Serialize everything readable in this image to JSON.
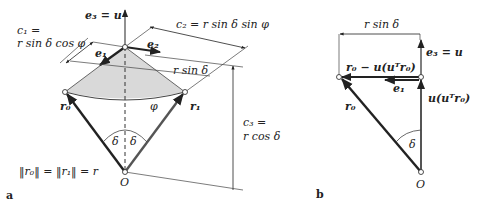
{
  "figure": {
    "panel_a": {
      "panel_label": "a",
      "labels": {
        "e3_eq_u": "e₃ = u",
        "c1_line1": "c₁ =",
        "c1_line2": "r sin δ cos φ",
        "c2": "c₂ = r sin δ sin φ",
        "e1": "e₁",
        "e2": "e₂",
        "r_sin_delta": "r sin δ",
        "r0": "r₀",
        "r1": "r₁",
        "phi": "φ",
        "delta_left": "δ",
        "delta_right": "δ",
        "c3_line1": "c₃ =",
        "c3_line2": "r cos δ",
        "norm_eq": "‖r₀‖ = ‖r₁‖ = r",
        "origin": "O"
      }
    },
    "panel_b": {
      "panel_label": "b",
      "labels": {
        "r_sin_delta": "r sin δ",
        "e3_eq_u": "e₃ = u",
        "projection": "r₀ − u(uᵀr₀)",
        "e1": "e₁",
        "u_component": "u(uᵀr₀)",
        "r0": "r₀",
        "delta": "δ",
        "origin": "O"
      }
    },
    "colors": {
      "line": "#222222",
      "shading": "#d9d9d9",
      "thin_line": "#444444"
    }
  }
}
